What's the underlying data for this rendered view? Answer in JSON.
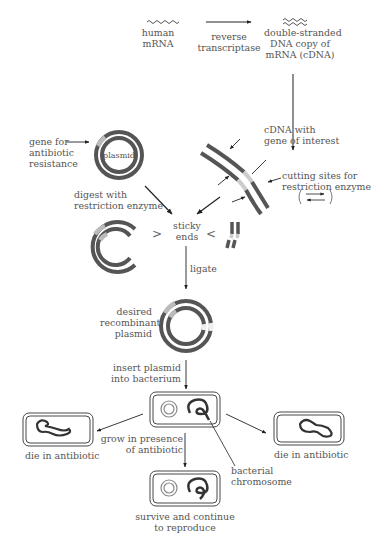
{
  "diagram": {
    "colors": {
      "dna_dark": "#555555",
      "dna_light": "#bbbbbb",
      "line": "#222222",
      "text": "#555555"
    },
    "nodes": {
      "human_mrna": {
        "line1": "human",
        "line2": "mRNA"
      },
      "reverse_transcriptase": {
        "line1": "reverse",
        "line2": "transcriptase"
      },
      "cdna": {
        "line1": "double-stranded",
        "line2": "DNA copy of",
        "line3": "mRNA (cDNA)"
      },
      "cdna_gene": {
        "line1": "cDNA with",
        "line2": "gene of interest"
      },
      "cutting_sites": {
        "line1": "cutting sites for",
        "line2": "restriction enzyme"
      },
      "gene_resistance": {
        "line1": "gene for",
        "line2": "antibiotic",
        "line3": "resistance"
      },
      "plasmid_label": "plasmid",
      "digest": {
        "line1": "digest with",
        "line2": "restriction enzyme"
      },
      "sticky_ends": {
        "line1": "sticky",
        "line2": "ends"
      },
      "ligate": "ligate",
      "recombinant": {
        "line1": "desired",
        "line2": "recombinant",
        "line3": "plasmid"
      },
      "insert": {
        "line1": "insert plasmid",
        "line2": "into bacterium"
      },
      "grow": {
        "line1": "grow in presence",
        "line2": "of antibiotic"
      },
      "die_left": "die in antibiotic",
      "die_right": "die in antibiotic",
      "bacterial_chromosome": {
        "line1": "bacterial",
        "line2": "chromosome"
      },
      "survive": {
        "line1": "survive and continue",
        "line2": "to reproduce"
      }
    }
  }
}
